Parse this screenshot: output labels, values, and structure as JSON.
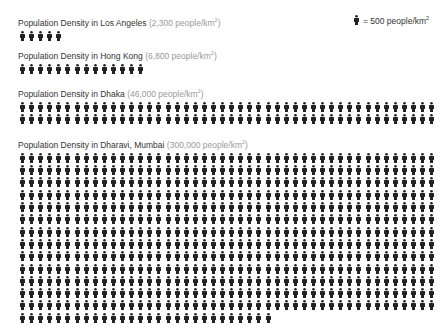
{
  "legend": {
    "unit_value": "= 500 people/km",
    "sup": "2",
    "icon": "person-icon"
  },
  "chart_data": {
    "type": "table",
    "unit": "people/km²",
    "icon_value": 500,
    "categories": [
      "Los Angeles",
      "Hong Kong",
      "Dhaka",
      "Dharavi, Mumbai"
    ],
    "values": [
      2300,
      6800,
      46000,
      300000
    ],
    "icons_per_row": 46
  },
  "sections": [
    {
      "title": "Population Density in Los Angeles",
      "value": "(2,300 people/km",
      "sup": "2",
      "close": ")",
      "icons": 5,
      "top": 15
    },
    {
      "title": "Population Density in Hong Kong",
      "value": "(6,800 people/km",
      "sup": "2",
      "close": ")",
      "icons": 14,
      "top": 48
    },
    {
      "title": "Population Density in Dhaka",
      "value": "(46,000 people/km",
      "sup": "2",
      "close": ")",
      "icons": 92,
      "top": 86
    },
    {
      "title": "Population Density in Dharavi, Mumbai",
      "value": "(300,000 people/km",
      "sup": "2",
      "close": ")",
      "icons": 626,
      "top": 137
    }
  ]
}
